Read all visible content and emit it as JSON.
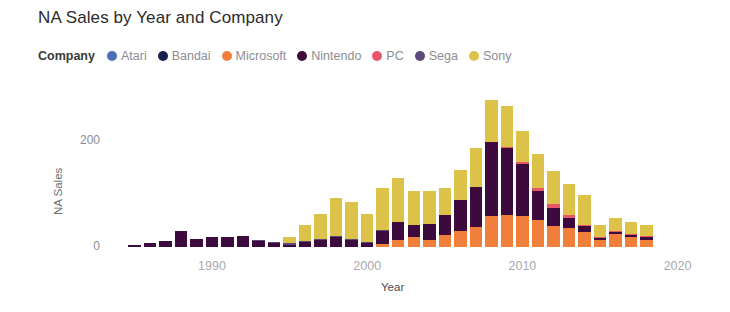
{
  "title": "NA Sales by Year and Company",
  "legend": {
    "label": "Company",
    "items": [
      {
        "name": "Atari",
        "color": "#4a6fb5"
      },
      {
        "name": "Bandai",
        "color": "#1a1f4e"
      },
      {
        "name": "Microsoft",
        "color": "#f07f3c"
      },
      {
        "name": "Nintendo",
        "color": "#3d0a3d"
      },
      {
        "name": "PC",
        "color": "#e8566a"
      },
      {
        "name": "Sega",
        "color": "#5b4a7a"
      },
      {
        "name": "Sony",
        "color": "#ddc24a"
      }
    ]
  },
  "axes": {
    "y": {
      "label": "NA Sales",
      "ticks": [
        "0",
        "200"
      ],
      "tick_values": [
        0,
        200
      ],
      "min": 0,
      "max": 290
    },
    "x": {
      "label": "Year",
      "ticks": [
        "1990",
        "2000",
        "2010",
        "2020"
      ],
      "tick_values": [
        1990,
        2000,
        2010,
        2020
      ],
      "min": 1984.2,
      "max": 2020.8
    }
  },
  "chart_data": {
    "type": "bar",
    "stacked": true,
    "title": "NA Sales by Year and Company",
    "xlabel": "Year",
    "ylabel": "NA Sales",
    "xlim": [
      1984.2,
      2020.8
    ],
    "ylim": [
      0,
      290
    ],
    "grid": false,
    "legend_position": "top",
    "legend_title": "Company",
    "categories": [
      1985,
      1986,
      1987,
      1988,
      1989,
      1990,
      1991,
      1992,
      1993,
      1994,
      1995,
      1996,
      1997,
      1998,
      1999,
      2000,
      2001,
      2002,
      2003,
      2004,
      2005,
      2006,
      2007,
      2008,
      2009,
      2010,
      2011,
      2012,
      2013,
      2014,
      2015,
      2016,
      2017,
      2018
    ],
    "series": [
      {
        "name": "Atari",
        "color": "#4a6fb5",
        "values": [
          0,
          0,
          0,
          0,
          0,
          0,
          0,
          0,
          0,
          0,
          0,
          0,
          0,
          0,
          0,
          0,
          0,
          0,
          0,
          0,
          0,
          0,
          0,
          0,
          0,
          0,
          0,
          0,
          0,
          0,
          0,
          0,
          0,
          0
        ]
      },
      {
        "name": "Bandai",
        "color": "#1a1f4e",
        "values": [
          0,
          0,
          0,
          0,
          0,
          0,
          0,
          0,
          0,
          0,
          0,
          0,
          0,
          0,
          0,
          0,
          0,
          0,
          0,
          0,
          0,
          0,
          0,
          0,
          0,
          0,
          0,
          0,
          0,
          0,
          0,
          0,
          0,
          0
        ]
      },
      {
        "name": "Microsoft",
        "color": "#f07f3c",
        "values": [
          0,
          0,
          0,
          0,
          0,
          0,
          0,
          0,
          0,
          0,
          0,
          0,
          0,
          0,
          0,
          0,
          6,
          14,
          18,
          14,
          22,
          30,
          38,
          59,
          61,
          58,
          51,
          40,
          36,
          28,
          13,
          24,
          18,
          14
        ]
      },
      {
        "name": "Nintendo",
        "color": "#3d0a3d",
        "values": [
          4,
          8,
          11,
          31,
          16,
          18,
          18,
          20,
          13,
          9,
          4,
          9,
          13,
          18,
          15,
          9,
          26,
          33,
          24,
          30,
          38,
          58,
          76,
          139,
          125,
          98,
          54,
          33,
          19,
          11,
          4,
          5,
          5,
          5
        ]
      },
      {
        "name": "PC",
        "color": "#e8566a",
        "values": [
          0,
          0,
          0,
          0,
          0,
          0,
          0,
          0,
          0,
          0,
          0,
          0,
          0,
          0,
          0,
          0,
          0,
          0,
          0,
          0,
          0,
          0,
          0,
          0,
          3,
          4,
          6,
          8,
          5,
          3,
          1,
          1,
          1,
          1
        ]
      },
      {
        "name": "Sega",
        "color": "#5b4a7a",
        "values": [
          0,
          0,
          0,
          0,
          0,
          0,
          0,
          0,
          1,
          1,
          3,
          3,
          2,
          2,
          1,
          1,
          1,
          0,
          0,
          0,
          0,
          0,
          0,
          0,
          0,
          0,
          0,
          0,
          0,
          0,
          0,
          0,
          0,
          0
        ]
      },
      {
        "name": "Sony",
        "color": "#ddc24a",
        "values": [
          0,
          0,
          0,
          0,
          0,
          0,
          0,
          0,
          0,
          0,
          12,
          30,
          47,
          73,
          68,
          52,
          78,
          83,
          63,
          62,
          52,
          57,
          73,
          79,
          78,
          58,
          64,
          62,
          58,
          57,
          24,
          24,
          23,
          21
        ]
      }
    ]
  }
}
